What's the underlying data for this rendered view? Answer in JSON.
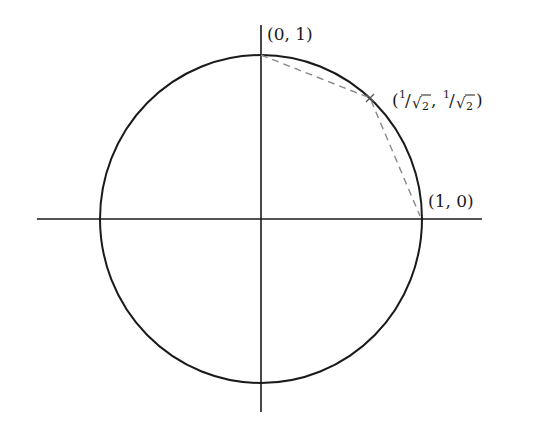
{
  "diagram": {
    "type": "unit-circle",
    "labels": {
      "top": "(0, 1)",
      "diag": {
        "open": "(",
        "num1": "1",
        "slash1": "/",
        "sqrt1": "√",
        "den1": "2",
        "comma": ",",
        "num2": "1",
        "slash2": "/",
        "sqrt2": "√",
        "den2": "2",
        "close": ")"
      },
      "right": "(1, 0)"
    },
    "points": [
      {
        "name": "top",
        "coords": [
          0,
          1
        ]
      },
      {
        "name": "diag",
        "coords": [
          "1/√2",
          "1/√2"
        ]
      },
      {
        "name": "right",
        "coords": [
          1,
          0
        ]
      }
    ],
    "colors": {
      "stroke": "#1a1a1a",
      "dashed": "#888888"
    }
  }
}
